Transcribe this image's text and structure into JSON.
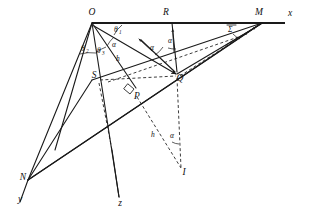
{
  "figure": {
    "background_color": "#ffffff",
    "line_color": "#1a1a1a",
    "width": 310,
    "height": 214
  },
  "axes": [
    {
      "id": "axis-x",
      "label": "x",
      "x": 290,
      "y": 16
    },
    {
      "id": "axis-y",
      "label": "y",
      "x": 22,
      "y": 198
    },
    {
      "id": "axis-z",
      "label": "z",
      "x": 117,
      "y": 203
    }
  ],
  "points": [
    {
      "id": "point-O",
      "label": "O",
      "x": 92,
      "y": 15
    },
    {
      "id": "point-R",
      "label": "R",
      "x": 166,
      "y": 15
    },
    {
      "id": "point-M",
      "label": "M",
      "x": 259,
      "y": 15
    },
    {
      "id": "point-Q",
      "label": "Q",
      "x": 178,
      "y": 76
    },
    {
      "id": "point-S",
      "label": "S",
      "x": 98,
      "y": 80
    },
    {
      "id": "point-P",
      "label": "P",
      "x": 136,
      "y": 94
    },
    {
      "id": "point-N",
      "label": "N",
      "x": 27,
      "y": 178
    },
    {
      "id": "point-I",
      "label": "I",
      "x": 182,
      "y": 172
    }
  ],
  "angle_labels": [
    {
      "id": "angle-theta1",
      "base": "θ",
      "sub": "1",
      "x": 116,
      "y": 30
    },
    {
      "id": "angle-theta2",
      "base": "θ",
      "sub": "2",
      "x": 84,
      "y": 49
    },
    {
      "id": "angle-theta3",
      "base": "θ",
      "sub": "3",
      "x": 100,
      "y": 51
    },
    {
      "id": "angle-alpha-O",
      "base": "α",
      "sub": "",
      "x": 114,
      "y": 45
    },
    {
      "id": "angle-alpha-mid",
      "base": "α",
      "sub": "",
      "x": 152,
      "y": 48
    },
    {
      "id": "angle-alpha-R",
      "base": "α",
      "sub": "",
      "x": 170,
      "y": 41
    },
    {
      "id": "angle-alpha-low",
      "base": "α",
      "sub": "",
      "x": 172,
      "y": 136
    },
    {
      "id": "angle-sigma",
      "base": "Σ",
      "sub": "",
      "x": 231,
      "y": 30
    }
  ],
  "segment_labels": [
    {
      "id": "length-h-upper",
      "label": "h",
      "x": 117,
      "y": 59
    },
    {
      "id": "length-h-lower",
      "label": "h",
      "x": 153,
      "y": 135
    }
  ],
  "markers": [
    {
      "id": "right-angle-at-P",
      "type": "right-angle-square",
      "x": 131,
      "y": 84
    }
  ]
}
